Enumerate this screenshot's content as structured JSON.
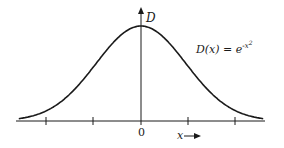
{
  "chart_data": {
    "type": "line",
    "title": "",
    "function": "D(x) = e^(-x^2)",
    "xlabel": "x",
    "ylabel": "D",
    "x_tick_labels": [
      "0"
    ],
    "x_ticks": [
      -2,
      -1,
      0,
      1,
      2
    ],
    "x": [
      -2.6,
      -2,
      -1.5,
      -1,
      -0.5,
      0,
      0.5,
      1,
      1.5,
      2,
      2.6
    ],
    "values": [
      0.001,
      0.018,
      0.105,
      0.368,
      0.779,
      1.0,
      0.779,
      0.368,
      0.105,
      0.018,
      0.001
    ],
    "xlim": [
      -2.6,
      2.6
    ],
    "ylim": [
      0,
      1.1
    ],
    "grid": false,
    "legend": null,
    "annotations": [
      "D(x) = e^{-x^2}"
    ]
  },
  "labels": {
    "y_axis": "D",
    "origin": "0",
    "x_axis": "x",
    "formula_lhs": "D(x) = e",
    "formula_exp": "-x",
    "formula_pow": "2"
  },
  "colors": {
    "stroke": "#1a1a1a",
    "background": "#ffffff"
  }
}
